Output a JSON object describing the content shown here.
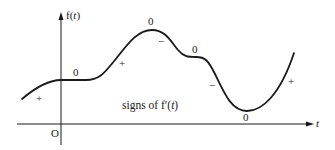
{
  "diagram": {
    "axes": {
      "y_label_prefix": "f(",
      "y_label_var": "t",
      "y_label_suffix": ")",
      "x_label": "t",
      "origin_label": "O"
    },
    "caption": {
      "prefix": "signs of f′(",
      "var": "t",
      "suffix": ")"
    },
    "signs": [
      {
        "id": "sign-left-plus",
        "text": "+"
      },
      {
        "id": "sign-first-zero",
        "text": "0"
      },
      {
        "id": "sign-rising-plus",
        "text": "+"
      },
      {
        "id": "sign-peak-zero",
        "text": "0"
      },
      {
        "id": "sign-after-peak-minus",
        "text": "−"
      },
      {
        "id": "sign-plateau-zero",
        "text": "0"
      },
      {
        "id": "sign-falling-minus",
        "text": "−"
      },
      {
        "id": "sign-min-zero",
        "text": "0"
      },
      {
        "id": "sign-right-plus",
        "text": "+"
      }
    ],
    "colors": {
      "ink": "#1a1a1a",
      "background": "#ffffff"
    }
  }
}
